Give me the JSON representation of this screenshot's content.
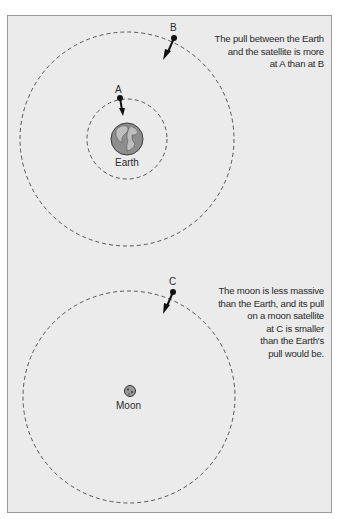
{
  "figure": {
    "top_panel": {
      "caption_lines": [
        "The pull between the Earth",
        "and the satellite is more",
        "at A than at B"
      ],
      "body_label": "Earth",
      "points": [
        {
          "id": "A",
          "label": "A"
        },
        {
          "id": "B",
          "label": "B"
        }
      ]
    },
    "bottom_panel": {
      "caption_lines": [
        "The moon is less massive",
        "than the Earth, and its pull",
        "on a moon satellite",
        "at C is smaller",
        "than the Earth's",
        "pull would be."
      ],
      "body_label": "Moon",
      "points": [
        {
          "id": "C",
          "label": "C"
        }
      ]
    },
    "colors": {
      "background": "#ebebeb",
      "ink": "#2a2a2a",
      "orbit": "#555555"
    }
  }
}
